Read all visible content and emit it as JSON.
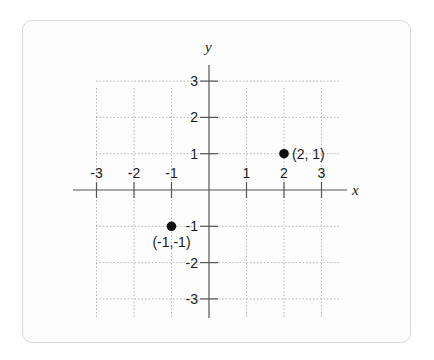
{
  "chart_data": {
    "type": "scatter",
    "title": "",
    "xlabel": "x",
    "ylabel": "y",
    "xlim": [
      -3,
      3
    ],
    "ylim": [
      -3,
      3
    ],
    "grid": true,
    "grid_style": "dotted",
    "x_ticks": [
      -3,
      -2,
      -1,
      1,
      2,
      3
    ],
    "y_ticks": [
      3,
      2,
      1,
      -1,
      -2,
      -3
    ],
    "x_tick_labels": [
      "-3",
      "-2",
      "-1",
      "1",
      "2",
      "3"
    ],
    "y_tick_labels": [
      "3",
      "2",
      "1",
      "-1",
      "-2",
      "-3"
    ],
    "points": [
      {
        "x": 2,
        "y": 1,
        "label": "(2, 1)"
      },
      {
        "x": -1,
        "y": -1,
        "label": "(-1,-1)"
      }
    ],
    "point_color": "#111111",
    "axis_color": "#555555",
    "grid_color": "#b5b5b5"
  }
}
